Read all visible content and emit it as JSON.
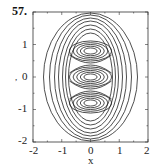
{
  "figure": {
    "number": "57."
  },
  "chart_data": {
    "type": "contour",
    "title": "",
    "xlabel": "x",
    "ylabel": "y",
    "xlim": [
      -2,
      2
    ],
    "ylim": [
      -2,
      2
    ],
    "x_ticks": [
      "-2",
      "-1",
      "0",
      "1",
      "2"
    ],
    "y_ticks": [
      "1",
      "0",
      "-1",
      "-2"
    ],
    "grid": false,
    "extrema": [
      {
        "x": 0,
        "y": 0.8,
        "kind": "center"
      },
      {
        "x": 0,
        "y": 0.0,
        "kind": "center"
      },
      {
        "x": 0,
        "y": -0.8,
        "kind": "center"
      }
    ],
    "saddles": [
      {
        "x": 0,
        "y": 0.4
      },
      {
        "x": 0,
        "y": -0.4
      }
    ]
  },
  "colors": {
    "line": "#222222",
    "frame": "#333333",
    "background": "#ffffff"
  }
}
